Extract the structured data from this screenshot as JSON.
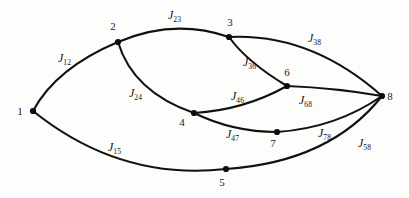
{
  "figure": {
    "kind": "undirected-graph-diagram",
    "background_color": "#fdfdfb",
    "stroke_color": "#111111",
    "node_color": "#0d0d0d",
    "width": 409,
    "height": 198
  },
  "nodes": [
    {
      "id": "1",
      "label": "1",
      "x": 33,
      "y": 111,
      "label_x": 20,
      "label_y": 115
    },
    {
      "id": "2",
      "label": "2",
      "x": 118,
      "y": 42,
      "label_x": 113,
      "label_y": 30
    },
    {
      "id": "3",
      "label": "3",
      "x": 229,
      "y": 37,
      "label_x": 230,
      "label_y": 26
    },
    {
      "id": "4",
      "label": "4",
      "x": 194,
      "y": 113,
      "label_x": 182,
      "label_y": 126
    },
    {
      "id": "5",
      "label": "5",
      "x": 226,
      "y": 169,
      "label_x": 222,
      "label_y": 186
    },
    {
      "id": "6",
      "label": "6",
      "x": 287,
      "y": 86,
      "label_x": 287,
      "label_y": 76
    },
    {
      "id": "7",
      "label": "7",
      "x": 277,
      "y": 132,
      "label_x": 273,
      "label_y": 147
    },
    {
      "id": "8",
      "label": "8",
      "x": 382,
      "y": 96,
      "label_x": 390,
      "label_y": 100
    }
  ],
  "edges": [
    {
      "id": "e12",
      "from": "1",
      "to": "2",
      "label_symbol": "J",
      "label_subscript": "12",
      "path": "M 33 111 Q 56 68 118 42",
      "label_x": 58,
      "label_y": 62
    },
    {
      "id": "e23",
      "from": "2",
      "to": "3",
      "label_symbol": "J",
      "label_subscript": "23",
      "path": "M 118 42 Q 174 18 229 37",
      "label_x": 168,
      "label_y": 19
    },
    {
      "id": "e24",
      "from": "2",
      "to": "4",
      "label_symbol": "J",
      "label_subscript": "24",
      "path": "M 118 42 Q 133 92 194 113",
      "label_x": 129,
      "label_y": 97
    },
    {
      "id": "e36",
      "from": "3",
      "to": "6",
      "label_symbol": "J",
      "label_subscript": "36",
      "path": "M 229 37 Q 247 62 287 86",
      "label_x": 243,
      "label_y": 66
    },
    {
      "id": "e38",
      "from": "3",
      "to": "8",
      "label_symbol": "J",
      "label_subscript": "38",
      "path": "M 229 37 Q 311 33 382 96",
      "label_x": 308,
      "label_y": 42
    },
    {
      "id": "e46",
      "from": "4",
      "to": "6",
      "label_symbol": "J",
      "label_subscript": "46",
      "path": "M 194 113 Q 244 110 287 86",
      "label_x": 231,
      "label_y": 100
    },
    {
      "id": "e47",
      "from": "4",
      "to": "7",
      "label_symbol": "J",
      "label_subscript": "47",
      "path": "M 194 113 Q 233 132 277 132",
      "label_x": 226,
      "label_y": 138
    },
    {
      "id": "e68",
      "from": "6",
      "to": "8",
      "label_symbol": "J",
      "label_subscript": "68",
      "path": "M 287 86 Q 336 88 382 96",
      "label_x": 299,
      "label_y": 104
    },
    {
      "id": "e78",
      "from": "7",
      "to": "8",
      "label_symbol": "J",
      "label_subscript": "78",
      "path": "M 277 132 Q 336 128 382 96",
      "label_x": 318,
      "label_y": 137
    },
    {
      "id": "e15",
      "from": "1",
      "to": "5",
      "label_symbol": "J",
      "label_subscript": "15",
      "path": "M 33 111 Q 120 181 226 169",
      "label_x": 108,
      "label_y": 151
    },
    {
      "id": "e58",
      "from": "5",
      "to": "8",
      "label_symbol": "J",
      "label_subscript": "58",
      "path": "M 226 169 Q 330 162 382 96",
      "label_x": 358,
      "label_y": 147
    }
  ]
}
